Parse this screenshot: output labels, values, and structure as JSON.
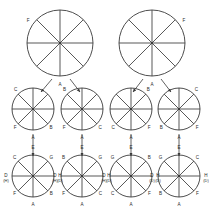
{
  "diagram": {
    "type": "wheel-tree-diagram",
    "stroke_color": "#3a3a3a",
    "label_color": "#2b2b2b",
    "background": "#ffffff",
    "spoke_count": 8,
    "rows": [
      {
        "row_id": "row-1",
        "circles": [
          {
            "id": "circle-top-left",
            "cx": 60,
            "cy": 43,
            "r": 33,
            "labels": [
              {
                "text": "F",
                "angle_deg": 215,
                "offset": 6
              },
              {
                "text": "A",
                "angle_deg": 90,
                "offset": 9
              }
            ]
          },
          {
            "id": "circle-top-right",
            "cx": 152,
            "cy": 43,
            "r": 33,
            "labels": [
              {
                "text": "F",
                "angle_deg": 325,
                "offset": 6
              },
              {
                "text": "A",
                "angle_deg": 90,
                "offset": 9
              }
            ]
          }
        ]
      },
      {
        "row_id": "row-2",
        "circles": [
          {
            "id": "circle-mid-1",
            "cx": 33,
            "cy": 109,
            "r": 21,
            "labels": [
              {
                "text": "C",
                "angle_deg": 228,
                "offset": 5
              },
              {
                "text": "F",
                "angle_deg": 133,
                "offset": 5
              },
              {
                "text": "B",
                "angle_deg": 46,
                "offset": 5
              },
              {
                "text": "A",
                "angle_deg": 90,
                "offset": 8
              }
            ]
          },
          {
            "id": "circle-mid-2",
            "cx": 82,
            "cy": 109,
            "r": 21,
            "labels": [
              {
                "text": "B",
                "angle_deg": 228,
                "offset": 5
              },
              {
                "text": "F",
                "angle_deg": 133,
                "offset": 5
              },
              {
                "text": "C",
                "angle_deg": 46,
                "offset": 5
              },
              {
                "text": "A",
                "angle_deg": 90,
                "offset": 8
              }
            ]
          },
          {
            "id": "circle-mid-3",
            "cx": 131,
            "cy": 109,
            "r": 21,
            "labels": [
              {
                "text": "B",
                "angle_deg": 312,
                "offset": 5
              },
              {
                "text": "C",
                "angle_deg": 133,
                "offset": 5
              },
              {
                "text": "F",
                "angle_deg": 46,
                "offset": 5
              },
              {
                "text": "A",
                "angle_deg": 90,
                "offset": 8
              }
            ]
          },
          {
            "id": "circle-mid-4",
            "cx": 179,
            "cy": 109,
            "r": 21,
            "labels": [
              {
                "text": "C",
                "angle_deg": 312,
                "offset": 5
              },
              {
                "text": "B",
                "angle_deg": 133,
                "offset": 5
              },
              {
                "text": "F",
                "angle_deg": 46,
                "offset": 5
              },
              {
                "text": "A",
                "angle_deg": 90,
                "offset": 8
              }
            ]
          }
        ]
      },
      {
        "row_id": "row-3",
        "circles": [
          {
            "id": "circle-bot-1",
            "cx": 33,
            "cy": 176,
            "r": 21,
            "labels": [
              {
                "text": "E",
                "angle_deg": 270,
                "offset": 7
              },
              {
                "text": "G",
                "angle_deg": 315,
                "offset": 5
              },
              {
                "text": "H",
                "angle_deg": 0,
                "offset": 6
              },
              {
                "text": "(D)",
                "angle_deg": 0,
                "offset": 6,
                "sub": true,
                "dy": 5
              },
              {
                "text": "B",
                "angle_deg": 45,
                "offset": 5
              },
              {
                "text": "A",
                "angle_deg": 90,
                "offset": 8
              },
              {
                "text": "F",
                "angle_deg": 135,
                "offset": 5
              },
              {
                "text": "D",
                "angle_deg": 180,
                "offset": 6
              },
              {
                "text": "(H)",
                "angle_deg": 180,
                "offset": 6,
                "sub": true,
                "dy": 5
              },
              {
                "text": "C",
                "angle_deg": 225,
                "offset": 5
              }
            ]
          },
          {
            "id": "circle-bot-2",
            "cx": 82,
            "cy": 176,
            "r": 21,
            "labels": [
              {
                "text": "E",
                "angle_deg": 270,
                "offset": 7
              },
              {
                "text": "G",
                "angle_deg": 315,
                "offset": 5
              },
              {
                "text": "H",
                "angle_deg": 0,
                "offset": 6
              },
              {
                "text": "(D)",
                "angle_deg": 0,
                "offset": 6,
                "sub": true,
                "dy": 5
              },
              {
                "text": "C",
                "angle_deg": 45,
                "offset": 5
              },
              {
                "text": "A",
                "angle_deg": 90,
                "offset": 8
              },
              {
                "text": "F",
                "angle_deg": 135,
                "offset": 5
              },
              {
                "text": "D",
                "angle_deg": 180,
                "offset": 6
              },
              {
                "text": "(H)",
                "angle_deg": 180,
                "offset": 6,
                "sub": true,
                "dy": 5
              },
              {
                "text": "B",
                "angle_deg": 225,
                "offset": 5
              }
            ]
          },
          {
            "id": "circle-bot-3",
            "cx": 131,
            "cy": 176,
            "r": 21,
            "labels": [
              {
                "text": "E",
                "angle_deg": 270,
                "offset": 7
              },
              {
                "text": "B",
                "angle_deg": 315,
                "offset": 5
              },
              {
                "text": "H",
                "angle_deg": 0,
                "offset": 6
              },
              {
                "text": "(D)",
                "angle_deg": 0,
                "offset": 6,
                "sub": true,
                "dy": 5
              },
              {
                "text": "F",
                "angle_deg": 45,
                "offset": 5
              },
              {
                "text": "A",
                "angle_deg": 90,
                "offset": 8
              },
              {
                "text": "C",
                "angle_deg": 135,
                "offset": 5
              },
              {
                "text": "D",
                "angle_deg": 180,
                "offset": 6
              },
              {
                "text": "(H)",
                "angle_deg": 180,
                "offset": 6,
                "sub": true,
                "dy": 5
              },
              {
                "text": "G",
                "angle_deg": 225,
                "offset": 5
              }
            ]
          },
          {
            "id": "circle-bot-4",
            "cx": 179,
            "cy": 176,
            "r": 21,
            "labels": [
              {
                "text": "E",
                "angle_deg": 270,
                "offset": 7
              },
              {
                "text": "C",
                "angle_deg": 315,
                "offset": 5
              },
              {
                "text": "H",
                "angle_deg": 0,
                "offset": 6
              },
              {
                "text": "(D)",
                "angle_deg": 0,
                "offset": 6,
                "sub": true,
                "dy": 5
              },
              {
                "text": "F",
                "angle_deg": 45,
                "offset": 5
              },
              {
                "text": "A",
                "angle_deg": 90,
                "offset": 8
              },
              {
                "text": "B",
                "angle_deg": 135,
                "offset": 5
              },
              {
                "text": "D",
                "angle_deg": 180,
                "offset": 6
              },
              {
                "text": "(D)",
                "angle_deg": 180,
                "offset": 6,
                "sub": true,
                "dy": 5
              },
              {
                "text": "G",
                "angle_deg": 225,
                "offset": 5
              }
            ]
          }
        ]
      }
    ],
    "arrows": [
      {
        "id": "arrow-tl-to-m1",
        "x1": 52,
        "y1": 79,
        "x2": 41,
        "y2": 92
      },
      {
        "id": "arrow-tl-to-m2",
        "x1": 70,
        "y1": 79,
        "x2": 80,
        "y2": 92
      },
      {
        "id": "arrow-tr-to-m3",
        "x1": 143,
        "y1": 79,
        "x2": 133,
        "y2": 92
      },
      {
        "id": "arrow-tr-to-m4",
        "x1": 161,
        "y1": 79,
        "x2": 171,
        "y2": 92
      },
      {
        "id": "arrow-m1-to-b1",
        "x1": 33,
        "y1": 134,
        "x2": 33,
        "y2": 156
      },
      {
        "id": "arrow-m2-to-b2",
        "x1": 82,
        "y1": 134,
        "x2": 82,
        "y2": 156
      },
      {
        "id": "arrow-m3-to-b3",
        "x1": 131,
        "y1": 134,
        "x2": 131,
        "y2": 156
      },
      {
        "id": "arrow-m4-to-b4",
        "x1": 179,
        "y1": 134,
        "x2": 179,
        "y2": 156
      }
    ]
  }
}
